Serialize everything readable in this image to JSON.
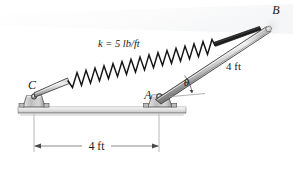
{
  "figure": {
    "type": "statics-free-body-diagram",
    "background_color": "#ffffff",
    "labels": {
      "spring_constant": "k = 5 lb/ft",
      "point_b": "B",
      "point_a": "A",
      "point_c": "C",
      "angle": "θ",
      "bar_length": "4 ft",
      "span_length": "4 ft"
    },
    "colors": {
      "outline": "#1a1a1a",
      "bar_light": "#f2f2f2",
      "bar_mid": "#b9b9b9",
      "bar_dark": "#8d8d8d",
      "ground_fill": "#e3e3e3",
      "ground_edge": "#9a9a9a",
      "support_fill": "#c9c9c9",
      "dimension_line": "#6e6e6e",
      "spring_stroke": "#141414"
    },
    "geometry": {
      "point_a": [
        159,
        97
      ],
      "point_b": [
        271,
        24
      ],
      "point_c": [
        34,
        94
      ],
      "bar_label_length": "4 ft",
      "span_label_length": "4 ft",
      "spring_coil_count": 16
    }
  }
}
